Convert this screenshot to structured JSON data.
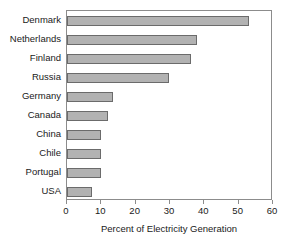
{
  "chart_data": {
    "type": "bar",
    "orientation": "horizontal",
    "title": "",
    "xlabel": "Percent of Electricity Generation",
    "ylabel": "",
    "xlim": [
      0,
      60
    ],
    "xticks": [
      0,
      10,
      20,
      30,
      40,
      50,
      60
    ],
    "xtick_labels": [
      "0",
      "10",
      "20",
      "30",
      "40",
      "50",
      "60"
    ],
    "grid": false,
    "legend": null,
    "bar_fill_color": "#b2b2b2",
    "bar_edge_color": "#6b6b6b",
    "axis_color": "#8c8c8c",
    "categories": [
      "Denmark",
      "Netherlands",
      "Finland",
      "Russia",
      "Germany",
      "Canada",
      "China",
      "Chile",
      "Portugal",
      "USA"
    ],
    "values": [
      53,
      38,
      36,
      29.7,
      13.4,
      12,
      10,
      10,
      10,
      7.3
    ]
  }
}
